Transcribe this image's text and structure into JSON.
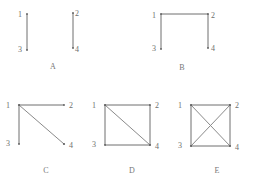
{
  "figure": {
    "title": "",
    "background_color": "#ffffff",
    "line_color": "#6f6f6f",
    "label_color": "#6e6e6e",
    "vertex_count": 4,
    "vertex_labels": [
      "1",
      "2",
      "3",
      "4"
    ],
    "panels": [
      {
        "id": "A",
        "caption": "A",
        "vertices": [
          {
            "label": "1",
            "x": 0,
            "y": 0
          },
          {
            "label": "2",
            "x": 1,
            "y": 0
          },
          {
            "label": "3",
            "x": 0,
            "y": 1
          },
          {
            "label": "4",
            "x": 1,
            "y": 1
          }
        ],
        "edges": [
          [
            "1",
            "3"
          ],
          [
            "2",
            "4"
          ]
        ],
        "edge_count": 2
      },
      {
        "id": "B",
        "caption": "B",
        "vertices": [
          {
            "label": "1",
            "x": 0,
            "y": 0
          },
          {
            "label": "2",
            "x": 1,
            "y": 0
          },
          {
            "label": "3",
            "x": 0,
            "y": 1
          },
          {
            "label": "4",
            "x": 1,
            "y": 1
          }
        ],
        "edges": [
          [
            "1",
            "2"
          ],
          [
            "1",
            "3"
          ],
          [
            "2",
            "4"
          ]
        ],
        "edge_count": 3
      },
      {
        "id": "C",
        "caption": "C",
        "vertices": [
          {
            "label": "1",
            "x": 0,
            "y": 0
          },
          {
            "label": "2",
            "x": 1,
            "y": 0
          },
          {
            "label": "3",
            "x": 0,
            "y": 1
          },
          {
            "label": "4",
            "x": 1,
            "y": 1
          }
        ],
        "edges": [
          [
            "1",
            "2"
          ],
          [
            "1",
            "3"
          ],
          [
            "1",
            "4"
          ]
        ],
        "edge_count": 3
      },
      {
        "id": "D",
        "caption": "D",
        "vertices": [
          {
            "label": "1",
            "x": 0,
            "y": 0
          },
          {
            "label": "2",
            "x": 1,
            "y": 0
          },
          {
            "label": "3",
            "x": 0,
            "y": 1
          },
          {
            "label": "4",
            "x": 1,
            "y": 1
          }
        ],
        "edges": [
          [
            "1",
            "2"
          ],
          [
            "1",
            "3"
          ],
          [
            "2",
            "4"
          ],
          [
            "3",
            "4"
          ],
          [
            "1",
            "4"
          ]
        ],
        "edge_count": 5
      },
      {
        "id": "E",
        "caption": "E",
        "vertices": [
          {
            "label": "1",
            "x": 0,
            "y": 0
          },
          {
            "label": "2",
            "x": 1,
            "y": 0
          },
          {
            "label": "3",
            "x": 0,
            "y": 1
          },
          {
            "label": "4",
            "x": 1,
            "y": 1
          }
        ],
        "edges": [
          [
            "1",
            "2"
          ],
          [
            "1",
            "3"
          ],
          [
            "2",
            "4"
          ],
          [
            "3",
            "4"
          ],
          [
            "1",
            "4"
          ],
          [
            "2",
            "3"
          ]
        ],
        "edge_count": 6
      }
    ]
  }
}
